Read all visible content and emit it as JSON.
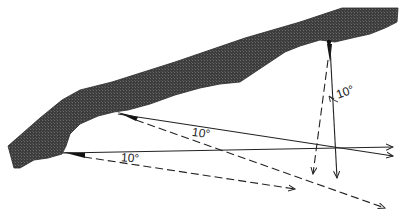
{
  "diagram": {
    "colors": {
      "rock": "#3a3a3a",
      "line": "#222222",
      "background": "#ffffff"
    },
    "labels": {
      "angle_top": "10°",
      "angle_middle": "10°",
      "angle_bottom": "10°"
    },
    "anchors": [
      {
        "name": "top-right-anchor",
        "x": 329,
        "y": 42
      },
      {
        "name": "middle-anchor",
        "x": 117,
        "y": 113
      },
      {
        "name": "bottom-left-anchor",
        "x": 63,
        "y": 153
      }
    ],
    "vectors": [
      {
        "from": "top-right-anchor",
        "style": "solid",
        "to": [
          337,
          178
        ]
      },
      {
        "from": "top-right-anchor",
        "style": "dashed",
        "to": [
          313,
          174
        ]
      },
      {
        "from": "middle-anchor",
        "style": "solid",
        "to": [
          393,
          156
        ]
      },
      {
        "from": "middle-anchor",
        "style": "dashed",
        "to": [
          385,
          208
        ]
      },
      {
        "from": "bottom-left-anchor",
        "style": "solid",
        "to": [
          393,
          147
        ]
      },
      {
        "from": "bottom-left-anchor",
        "style": "dashed",
        "to": [
          295,
          189
        ]
      }
    ]
  }
}
